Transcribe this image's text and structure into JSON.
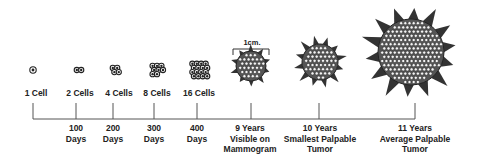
{
  "diagram": {
    "scale_bar": {
      "label": "1cm."
    },
    "cell_stages": [
      {
        "label": "1 Cell",
        "x": 36,
        "cx": 33,
        "cells": 1
      },
      {
        "label": "2 Cells",
        "x": 80,
        "cx": 79,
        "cells": 2
      },
      {
        "label": "4 Cells",
        "x": 119,
        "cx": 115,
        "cells": 4
      },
      {
        "label": "8 Cells",
        "x": 157,
        "cx": 157,
        "cells": 8
      },
      {
        "label": "16 Cells",
        "x": 199,
        "cx": 199,
        "cells": 16
      }
    ],
    "timeline": {
      "ticks": [
        {
          "x": 33,
          "lines": []
        },
        {
          "x": 76,
          "lines": [
            "100",
            "Days"
          ]
        },
        {
          "x": 113,
          "lines": [
            "200",
            "Days"
          ]
        },
        {
          "x": 154,
          "lines": [
            "300",
            "Days"
          ]
        },
        {
          "x": 197,
          "lines": [
            "400",
            "Days"
          ]
        },
        {
          "x": 251,
          "lines": [
            "9 Years",
            "Visible on",
            "Mammogram"
          ]
        },
        {
          "x": 319,
          "lines": [
            "10 Years",
            "Smallest Palpable",
            "Tumor"
          ]
        },
        {
          "x": 415,
          "lines": [
            "11 Years",
            "Average Palpable",
            "Tumor"
          ]
        }
      ],
      "labels": {
        "d100": "100\nDays",
        "d200": "200\nDays",
        "d300": "300\nDays",
        "d400": "400\nDays",
        "y9": "9 Years\nVisible on\nMammogram",
        "y10": "10 Years\nSmallest Palpable\nTumor",
        "y11": "11 Years\nAverage Palpable\nTumor"
      }
    },
    "tumors": [
      {
        "name": "9-year tumor",
        "cx": 251,
        "cy": 66,
        "r": 15,
        "spikes": 10,
        "spike_len": 6
      },
      {
        "name": "10-year tumor",
        "cx": 320,
        "cy": 62,
        "r": 18,
        "spikes": 12,
        "spike_len": 9
      },
      {
        "name": "11-year tumor",
        "cx": 411,
        "cy": 52,
        "r": 33,
        "spikes": 14,
        "spike_len": 16
      }
    ],
    "colors": {
      "ink": "#222222",
      "line": "#555555",
      "cell_fill": "#ffffff",
      "tumor_shade": "#3a3a3a"
    }
  }
}
